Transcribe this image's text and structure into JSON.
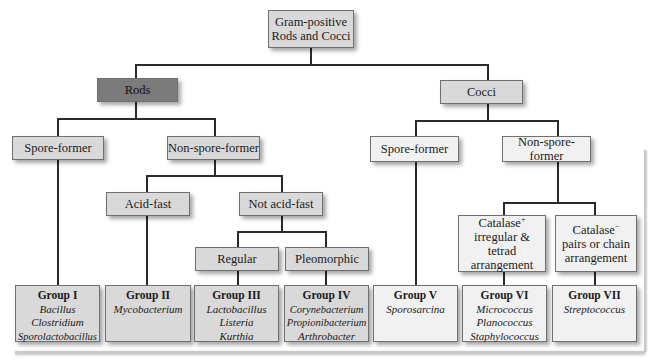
{
  "diagram": {
    "root": {
      "line1": "Gram-positive",
      "line2": "Rods and Cocci"
    },
    "rods": {
      "label": "Rods",
      "spore_former": "Spore-former",
      "non_spore_former": "Non-spore-former",
      "acid_fast": "Acid-fast",
      "not_acid_fast": "Not acid-fast",
      "regular": "Regular",
      "pleomorphic": "Pleomorphic"
    },
    "cocci": {
      "label": "Cocci",
      "spore_former": "Spore-former",
      "non_spore_former": "Non-spore-former",
      "catalase_pos": {
        "line1": "Catalase",
        "sup": "+",
        "line2": "irregular & tetrad",
        "line3": "arrangement"
      },
      "catalase_neg": {
        "line1": "Catalase",
        "sup": "−",
        "line2": "pairs or chain",
        "line3": "arrangement"
      }
    },
    "groups": [
      {
        "title": "Group I",
        "species": [
          "Bacillus",
          "Clostridium",
          "Sporolactobacillus"
        ]
      },
      {
        "title": "Group II",
        "species": [
          "Mycobacterium"
        ]
      },
      {
        "title": "Group III",
        "species": [
          "Lactobacillus",
          "Listeria",
          "Kurthia"
        ]
      },
      {
        "title": "Group IV",
        "species": [
          "Corynebacterium",
          "Propionibacterium",
          "Arthrobacter"
        ]
      },
      {
        "title": "Group V",
        "species": [
          "Sporosarcina"
        ]
      },
      {
        "title": "Group VI",
        "species": [
          "Micrococcus",
          "Planococcus",
          "Staphylococcus"
        ]
      },
      {
        "title": "Group VII",
        "species": [
          "Streptococcus"
        ]
      }
    ],
    "colors": {
      "box": "#d9d9d9",
      "box_dark": "#7b7b7b",
      "box_light": "#f1f1f1",
      "line": "#2a2a2a"
    }
  }
}
